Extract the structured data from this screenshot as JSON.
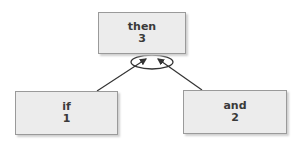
{
  "nodes": {
    "top": {
      "label": "then",
      "value": "3"
    },
    "left": {
      "label": "if",
      "value": "1"
    },
    "right": {
      "label": "and",
      "value": "2"
    }
  },
  "colors": {
    "box_fill": "#ececec",
    "box_border": "#9a9a9a",
    "line": "#333333"
  }
}
